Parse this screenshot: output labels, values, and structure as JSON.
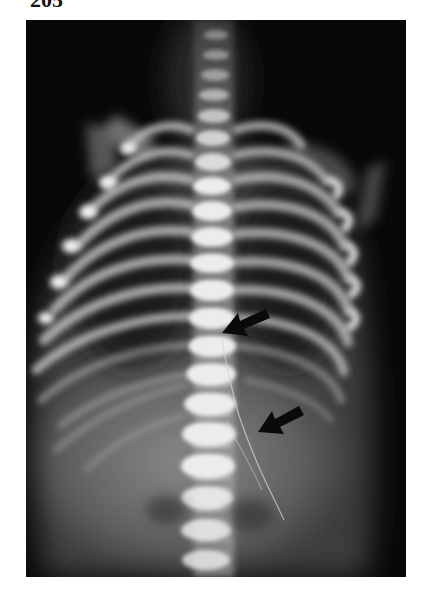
{
  "figure": {
    "number": "205",
    "image_type": "radiograph",
    "view": "frontal chest and abdomen",
    "annotations": [
      {
        "type": "arrow",
        "name": "upper-arrow",
        "direction": "pointing down-left",
        "tip": [
          222,
          333
        ],
        "tail": [
          268,
          315
        ]
      },
      {
        "type": "arrow",
        "name": "lower-arrow",
        "direction": "pointing down-left",
        "tip": [
          258,
          432
        ],
        "tail": [
          303,
          410
        ]
      }
    ]
  },
  "colors": {
    "page_background": "#ffffff",
    "film_background": "#0a0a0a",
    "bone": "#e8e8e8",
    "soft_tissue": "#6a6a6a",
    "arrow": "#0a0a0a",
    "label": "#111111"
  }
}
